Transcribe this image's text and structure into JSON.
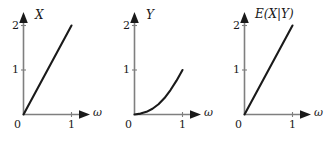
{
  "figure": {
    "background_color": "#ffffff",
    "axis_color": "#7f7f7f",
    "arrow_color": "#1a1a1a",
    "curve_color": "#1a1a1a",
    "text_color": "#1a1a1a"
  },
  "chart_data": [
    {
      "type": "line",
      "title": "X",
      "ylabel": "X",
      "xlabel": "ω",
      "xlim": [
        0,
        1.3
      ],
      "ylim": [
        0,
        2.25
      ],
      "xticks": [
        0,
        1
      ],
      "xtick_labels": [
        "0",
        "1"
      ],
      "yticks": [
        1,
        2
      ],
      "ytick_labels": [
        "1",
        "2"
      ],
      "grid": false,
      "legend": "none",
      "origin_label": "0",
      "series": [
        {
          "name": "X",
          "x": [
            0,
            0.25,
            0.5,
            0.75,
            1
          ],
          "values": [
            0,
            0.5,
            1,
            1.5,
            2
          ]
        }
      ]
    },
    {
      "type": "line",
      "title": "Y",
      "ylabel": "Y",
      "xlabel": "ω",
      "xlim": [
        0,
        1.3
      ],
      "ylim": [
        0,
        2.25
      ],
      "xticks": [
        0,
        1
      ],
      "xtick_labels": [
        "0",
        "1"
      ],
      "yticks": [
        1,
        2
      ],
      "ytick_labels": [
        "1",
        "2"
      ],
      "grid": false,
      "legend": "none",
      "origin_label": "0",
      "series": [
        {
          "name": "Y",
          "x": [
            0,
            0.125,
            0.25,
            0.375,
            0.5,
            0.625,
            0.75,
            0.875,
            1
          ],
          "values": [
            0,
            0.02,
            0.06,
            0.13,
            0.23,
            0.37,
            0.55,
            0.76,
            1
          ]
        }
      ]
    },
    {
      "type": "line",
      "title": "E(X|Y)",
      "ylabel": "E(X|Y)",
      "xlabel": "ω",
      "xlim": [
        0,
        1.3
      ],
      "ylim": [
        0,
        2.25
      ],
      "xticks": [
        0,
        1
      ],
      "xtick_labels": [
        "0",
        "1"
      ],
      "yticks": [
        1,
        2
      ],
      "ytick_labels": [
        "1",
        "2"
      ],
      "grid": false,
      "legend": "none",
      "origin_label": "0",
      "series": [
        {
          "name": "E(X|Y)",
          "x": [
            0,
            0.25,
            0.5,
            0.75,
            1
          ],
          "values": [
            0,
            0.5,
            1,
            1.5,
            2
          ]
        }
      ]
    }
  ]
}
